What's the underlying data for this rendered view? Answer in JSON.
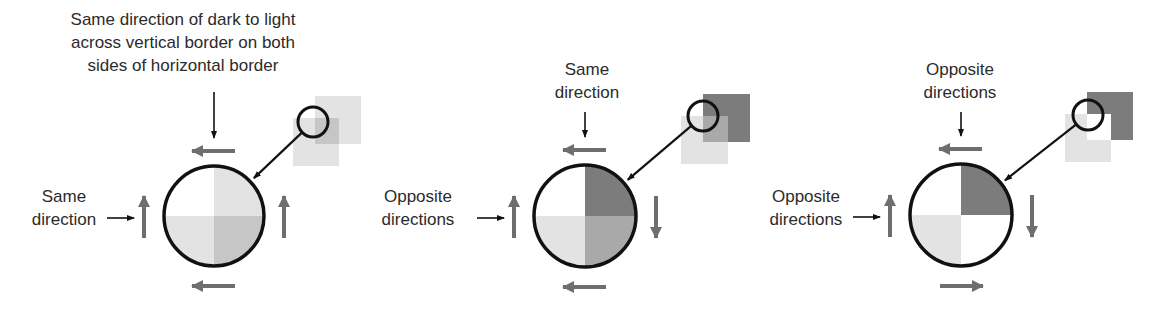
{
  "colors": {
    "white": "#ffffff",
    "light": "#e3e3e3",
    "medium": "#c6c6c6",
    "mediumdark": "#a9a9a9",
    "dark": "#7c7c7c",
    "outline": "#111111",
    "gray_arrow": "#6e6e6e",
    "thin_arrow": "#111111"
  },
  "panels": [
    {
      "id": "panel-1",
      "top_label": [
        "Same direction of dark to light",
        "across vertical border on both",
        "sides of horizontal border"
      ],
      "left_label": [
        "Same",
        "direction"
      ],
      "circle": {
        "cx": 214,
        "cy": 216,
        "r": 50,
        "quadrants": {
          "tl": "white",
          "tr": "light",
          "bl": "light",
          "br": "medium"
        }
      },
      "arrows": {
        "top": "left",
        "bottom": "left",
        "left": "up",
        "right": "up"
      },
      "inset": {
        "squares": [
          {
            "x": 315,
            "y": 96,
            "w": 46,
            "h": 48,
            "color": "light"
          },
          {
            "x": 293,
            "y": 118,
            "w": 46,
            "h": 48,
            "color": "light"
          },
          {
            "x": 315,
            "y": 118,
            "w": 24,
            "h": 26,
            "color": "medium"
          }
        ],
        "circle": {
          "cx": 313,
          "cy": 122,
          "r": 15
        }
      }
    },
    {
      "id": "panel-2",
      "top_label": [
        "Same",
        "direction"
      ],
      "left_label": [
        "Opposite",
        "directions"
      ],
      "circle": {
        "cx": 585,
        "cy": 216,
        "r": 51,
        "quadrants": {
          "tl": "white",
          "tr": "dark",
          "bl": "light",
          "br": "mediumdark"
        }
      },
      "arrows": {
        "top": "left",
        "bottom": "left",
        "left": "up",
        "right": "down"
      },
      "inset": {
        "squares": [
          {
            "x": 703,
            "y": 94,
            "w": 47,
            "h": 48,
            "color": "dark"
          },
          {
            "x": 681,
            "y": 116,
            "w": 47,
            "h": 48,
            "color": "light"
          },
          {
            "x": 703,
            "y": 116,
            "w": 25,
            "h": 26,
            "color": "mediumdark"
          }
        ],
        "circle": {
          "cx": 703,
          "cy": 116,
          "r": 15
        }
      }
    },
    {
      "id": "panel-3",
      "top_label": [
        "Opposite",
        "directions"
      ],
      "left_label": [
        "Opposite",
        "directions"
      ],
      "circle": {
        "cx": 961,
        "cy": 215,
        "r": 51,
        "quadrants": {
          "tl": "white",
          "tr": "dark",
          "bl": "light",
          "br": "white"
        }
      },
      "arrows": {
        "top": "left",
        "bottom": "right",
        "left": "up",
        "right": "down"
      },
      "inset": {
        "squares": [
          {
            "x": 1087,
            "y": 92,
            "w": 46,
            "h": 48,
            "color": "dark"
          },
          {
            "x": 1065,
            "y": 114,
            "w": 46,
            "h": 48,
            "color": "light"
          },
          {
            "x": 1087,
            "y": 114,
            "w": 24,
            "h": 26,
            "color": "white"
          }
        ],
        "circle": {
          "cx": 1088,
          "cy": 115,
          "r": 15
        }
      }
    }
  ]
}
